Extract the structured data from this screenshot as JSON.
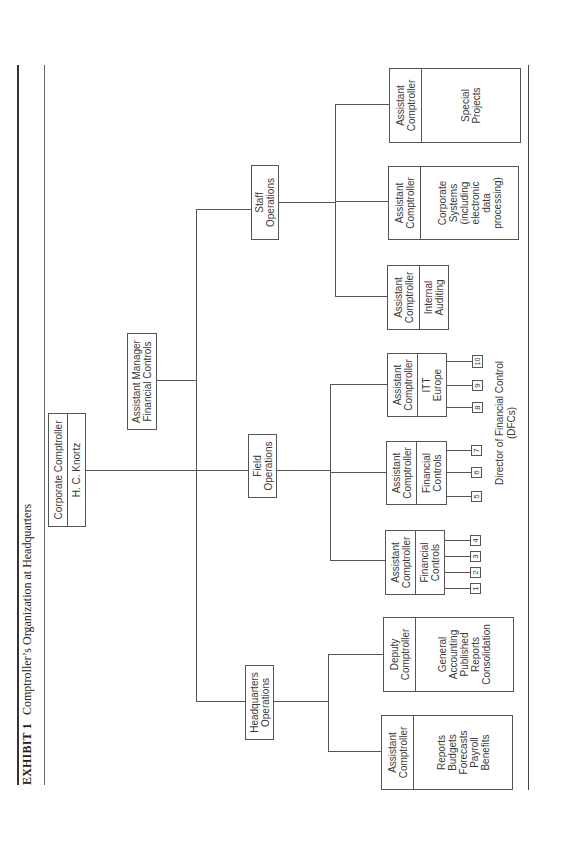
{
  "exhibit": {
    "label": "EXHIBIT 1",
    "title": "Comptroller’s Organization at Headquarters"
  },
  "top": {
    "title": "Corporate Comptroller",
    "name": "H. C. Knortz"
  },
  "staff_unit": {
    "label": "Assistant Manager\nFinancial Controls"
  },
  "divisions": [
    {
      "label": "Headquarters\nOperations",
      "units": [
        {
          "title": "Assistant\nComptroller",
          "function": "Reports\nBudgets\nForecasts\nPayroll\nBenefits"
        },
        {
          "title": "Deputy\nComptroller",
          "function": "General\nAccounting\nPublished\nReports\nConsolidation"
        }
      ]
    },
    {
      "label": "Field\nOperations",
      "units": [
        {
          "title": "Assistant\nComptroller",
          "function": "Financial\nControls",
          "dfcs": [
            "1",
            "2",
            "3",
            "4"
          ]
        },
        {
          "title": "Assistant\nComptroller",
          "function": "Financial\nControls",
          "dfcs": [
            "5",
            "6",
            "7"
          ]
        },
        {
          "title": "Assistant\nComptroller",
          "function": "ITT\nEurope",
          "dfcs": [
            "8",
            "9",
            "10"
          ]
        }
      ],
      "dfc_caption": "Director of Financial Control\n(DFCs)"
    },
    {
      "label": "Staff\nOperations",
      "units": [
        {
          "title": "Assistant\nComptroller",
          "function": "Internal\nAuditing"
        },
        {
          "title": "Assistant\nComptroller",
          "function": "Corporate\nSystems\n(including\nelectronic\ndata\nprocessing)"
        },
        {
          "title": "Assistant\nComptroller",
          "function": "Special\nProjects"
        }
      ]
    }
  ],
  "colors": {
    "line": "#555555",
    "text": "#3a3a3a",
    "background": "#ffffff"
  }
}
